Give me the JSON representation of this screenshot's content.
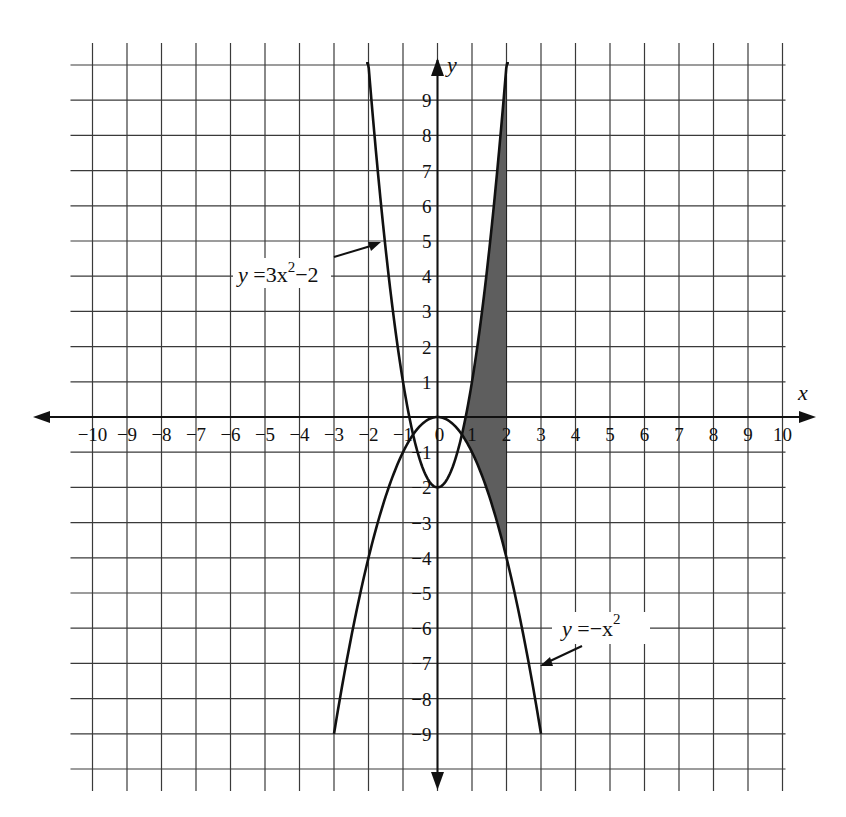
{
  "chart_data": {
    "type": "line",
    "title": "",
    "xlabel": "x",
    "ylabel": "y",
    "xlim": [
      -10,
      10
    ],
    "ylim": [
      -10,
      10
    ],
    "grid": true,
    "x_tick_labels": [
      "-10",
      "-9",
      "-8",
      "-7",
      "-6",
      "-5",
      "-4",
      "-3",
      "-2",
      "-1",
      "0",
      "1",
      "2",
      "3",
      "4",
      "5",
      "6",
      "7",
      "8",
      "9",
      "10"
    ],
    "y_tick_labels": [
      "9",
      "8",
      "7",
      "6",
      "5",
      "4",
      "3",
      "2",
      "1",
      "-1",
      "-2",
      "-3",
      "-4",
      "-5",
      "-6",
      "-7",
      "-8",
      "-9"
    ],
    "series": [
      {
        "name": "y = 3x^2 - 2",
        "label_text": "y =3x²−2",
        "expression": "3*x^2-2",
        "x_range": [
          -2.07,
          2.07
        ],
        "points": [
          [
            -2,
            10
          ],
          [
            -1.5,
            4.75
          ],
          [
            -1,
            1
          ],
          [
            -0.5,
            -1.25
          ],
          [
            0,
            -2
          ],
          [
            0.5,
            -1.25
          ],
          [
            1,
            1
          ],
          [
            1.5,
            4.75
          ],
          [
            2,
            10
          ]
        ]
      },
      {
        "name": "y = -x^2",
        "label_text": "y =−x²",
        "expression": "-x^2",
        "x_range": [
          -3,
          3
        ],
        "points": [
          [
            -3,
            -9
          ],
          [
            -2,
            -4
          ],
          [
            -1,
            -1
          ],
          [
            0,
            0
          ],
          [
            1,
            -1
          ],
          [
            2,
            -4
          ],
          [
            3,
            -9
          ]
        ]
      }
    ],
    "shaded_region": {
      "description": "Area between y=3x^2-2 (top) and y=-x^2 (bottom) from their intersection to x=2",
      "x_from": 0.707,
      "x_to": 2,
      "upper": "3x^2-2",
      "lower": "-x^2",
      "color": "#5e5e5e"
    },
    "annotations": [
      {
        "text": "y =3x²−2",
        "points_to": [
          -1.75,
          6
        ]
      },
      {
        "text": "y =−x²",
        "points_to": [
          2.6,
          -7
        ]
      }
    ],
    "legend": "none (inline annotations with arrows)"
  },
  "labels": {
    "x_axis": "x",
    "y_axis": "y",
    "eq1_y": "y",
    "eq1_rest": " =3x",
    "eq1_sup": "2",
    "eq1_tail": "−2",
    "eq2_y": "y",
    "eq2_rest": " =−x",
    "eq2_sup": "2"
  }
}
